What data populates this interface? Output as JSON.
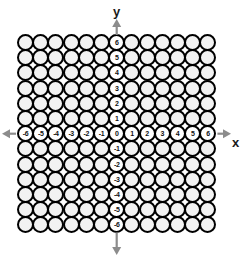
{
  "diagram": {
    "type": "coordinate-grid-of-circles",
    "title": "",
    "grid": {
      "columns": 13,
      "rows": 13,
      "cell_pitch": 15.2,
      "circle_diameter": 17,
      "origin_left": 17,
      "origin_top": 34,
      "circle_fill": "#f2f2f2",
      "circle_stroke": "#000000",
      "background": "#ffffff"
    },
    "axes": {
      "x": {
        "label": "x",
        "labels": [
          "-6",
          "-5",
          "-4",
          "-3",
          "-2",
          "-1",
          "0",
          "1",
          "2",
          "3",
          "4",
          "5",
          "6"
        ],
        "row_index": 6,
        "arrow_color": "#8c8c8c",
        "arrow_left": true,
        "arrow_right": true
      },
      "y": {
        "label": "y",
        "labels": [
          "6",
          "5",
          "4",
          "3",
          "2",
          "1",
          "0",
          "-1",
          "-2",
          "-3",
          "-4",
          "-5",
          "-6"
        ],
        "column_index": 6,
        "arrow_color": "#8c8c8c",
        "arrow_up": true,
        "arrow_down": true
      },
      "origin_label": "0"
    },
    "colors": {
      "stroke": "#000000",
      "text": "#111111",
      "axis_label": "#1a1a1a",
      "arrow": "#8c8c8c",
      "cell_fill": "#f2f2f2",
      "page_background": "#ffffff"
    }
  }
}
